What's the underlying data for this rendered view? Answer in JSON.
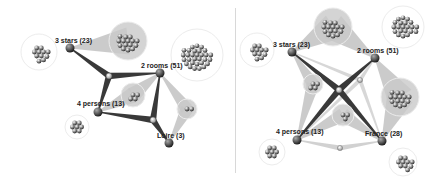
{
  "left_diagram": {
    "nodes": [
      {
        "id": "3stars",
        "label": "3 stars (23)",
        "x": 70,
        "y": 48,
        "lx": 55,
        "ly": 37
      },
      {
        "id": "2rooms",
        "label": "2 rooms (51)",
        "x": 160,
        "y": 73,
        "lx": 141,
        "ly": 62
      },
      {
        "id": "4persons",
        "label": "4 persons (13)",
        "x": 98,
        "y": 112,
        "lx": 77,
        "ly": 100
      },
      {
        "id": "loire",
        "label": "Loire (3)",
        "x": 169,
        "y": 143,
        "lx": 157,
        "ly": 132
      }
    ],
    "hubs": [
      {
        "x": 109,
        "y": 76,
        "links": [
          "3stars",
          "2rooms",
          "4persons"
        ],
        "style": "dark"
      },
      {
        "x": 153,
        "y": 120,
        "links": [
          "2rooms",
          "4persons",
          "loire"
        ],
        "style": "dark"
      }
    ],
    "clusters": [
      {
        "cx": 39,
        "cy": 52,
        "r": 16,
        "n": 11,
        "attach": null
      },
      {
        "cx": 128,
        "cy": 41,
        "r": 17,
        "n": 15,
        "attach": "3stars"
      },
      {
        "cx": 197,
        "cy": 55,
        "r": 24,
        "n": 30,
        "attach": null
      },
      {
        "cx": 133,
        "cy": 95,
        "r": 10,
        "n": 4,
        "attach": "2rooms-4persons"
      },
      {
        "cx": 187,
        "cy": 109,
        "r": 8,
        "n": 2,
        "attach": "2rooms-loire"
      },
      {
        "cx": 77,
        "cy": 127,
        "r": 10,
        "n": 7,
        "attach": null
      }
    ]
  },
  "right_diagram": {
    "nodes": [
      {
        "id": "3stars",
        "label": "3 stars (23)",
        "x": 292,
        "y": 52,
        "lx": 273,
        "ly": 41
      },
      {
        "id": "2rooms",
        "label": "2 rooms (51)",
        "x": 375,
        "y": 58,
        "lx": 357,
        "ly": 47
      },
      {
        "id": "4persons",
        "label": "4 persons (13)",
        "x": 297,
        "y": 140,
        "lx": 276,
        "ly": 128
      },
      {
        "id": "france",
        "label": "France (28)",
        "x": 382,
        "y": 141,
        "lx": 365,
        "ly": 130
      }
    ],
    "hubs": [
      {
        "x": 339,
        "y": 90,
        "links": [
          "3stars",
          "2rooms",
          "4persons",
          "france"
        ],
        "style": "dark"
      }
    ],
    "clusters": [
      {
        "cx": 257,
        "cy": 50,
        "r": 15,
        "n": 11,
        "attach": null
      },
      {
        "cx": 333,
        "cy": 27,
        "r": 17,
        "n": 15,
        "attach": "3stars-2rooms"
      },
      {
        "cx": 403,
        "cy": 27,
        "r": 19,
        "n": 21,
        "attach": null
      },
      {
        "cx": 313,
        "cy": 84,
        "r": 8,
        "n": 4,
        "attach": "3stars-4persons"
      },
      {
        "cx": 400,
        "cy": 97,
        "r": 17,
        "n": 15,
        "attach": "2rooms-france"
      },
      {
        "cx": 343,
        "cy": 115,
        "r": 9,
        "n": 3,
        "attach": "4persons-france"
      },
      {
        "cx": 272,
        "cy": 152,
        "r": 11,
        "n": 7,
        "attach": null
      },
      {
        "cx": 403,
        "cy": 162,
        "r": 12,
        "n": 10,
        "attach": null
      }
    ],
    "small_hubs": [
      {
        "x": 360,
        "y": 80
      },
      {
        "x": 340,
        "y": 148
      }
    ]
  }
}
